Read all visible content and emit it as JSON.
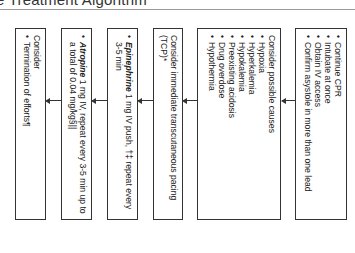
{
  "header": {
    "title": "e Treatment Algorithm"
  },
  "flow": {
    "direction": "right-to-left (rotated 90deg)",
    "steps": [
      {
        "id": "confirm",
        "items": [
          "Continue CPR",
          "Intubate at once",
          "Obtain IV access",
          "Confirm asystole in more than one lead"
        ]
      },
      {
        "id": "causes",
        "lead": "Consider possible causes",
        "items": [
          "Hypoxia",
          "Hyperkalemia",
          "Hypokalemia",
          "Preexisting acidosis",
          "Drug overdose",
          "Hypothermia"
        ]
      },
      {
        "id": "pacing",
        "lead": "Consider immediate transcutaneous pacing (TCP)*"
      },
      {
        "id": "epinephrine",
        "drug": "Epinephrine",
        "text": " 1 mg IV push, †‡ repeat every 3-5 min"
      },
      {
        "id": "atropine",
        "drug": "Atropine",
        "text": " 1 mg IV, repeat every 3-5 min up to a total of 0.04 mg/kg§||"
      },
      {
        "id": "termination",
        "lead": "Consider",
        "items": [
          "Termination of efforts¶"
        ]
      }
    ]
  }
}
